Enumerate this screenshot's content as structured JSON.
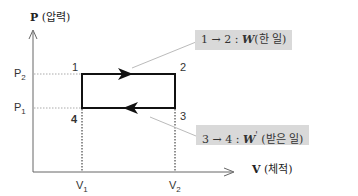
{
  "diagram": {
    "y_axis": {
      "symbol": "P",
      "label": "(압력)"
    },
    "x_axis": {
      "symbol": "V",
      "label": "(체적)"
    },
    "pressure_ticks": [
      {
        "base": "P",
        "sub": "2"
      },
      {
        "base": "P",
        "sub": "1"
      }
    ],
    "volume_ticks": [
      {
        "base": "V",
        "sub": "1"
      },
      {
        "base": "V",
        "sub": "2"
      }
    ],
    "points": {
      "p1": "1",
      "p2": "2",
      "p3": "3",
      "p4": "4"
    },
    "callouts": [
      {
        "process": "1 → 2 :",
        "symbol": "W",
        "prime": "",
        "desc": "(한 일)"
      },
      {
        "process": "3 → 4 :",
        "symbol": "W",
        "prime": "'",
        "desc": "(받은 일)"
      }
    ],
    "colors": {
      "line": "#111111",
      "callout_bg": "#d9d9d9",
      "leader": "#bbbbbb",
      "guide": "#888888"
    }
  }
}
